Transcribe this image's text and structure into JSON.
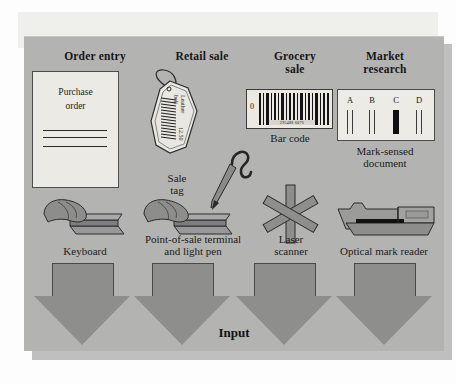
{
  "figure": {
    "background_color": "#b3b3b1",
    "bottom_label": "Input"
  },
  "columns": [
    {
      "title": "Order entry",
      "media": {
        "type": "purchase-order-document",
        "line1": "Purchase",
        "line2": "order"
      },
      "media_caption": "",
      "device": "keyboard-illustration",
      "device_caption": "Keyboard"
    },
    {
      "title": "Retail sale",
      "media": {
        "type": "sale-tag",
        "item": "Leather",
        "item2": "belt",
        "price": "12.50"
      },
      "media_caption_line1": "Sale",
      "media_caption_line2": "tag",
      "device": "pos-terminal-and-light-pen-illustration",
      "device_caption_line1": "Point-of-sale terminal",
      "device_caption_line2": "and light pen"
    },
    {
      "title_line1": "Grocery",
      "title_line2": "sale",
      "media": {
        "type": "bar-code",
        "lead_digit": "0",
        "number": "295488 6076"
      },
      "media_caption": "Bar code",
      "device": "laser-scanner-illustration",
      "device_caption_line1": "Laser",
      "device_caption_line2": "scanner"
    },
    {
      "title_line1": "Market",
      "title_line2": "research",
      "media": {
        "type": "mark-sensed-document",
        "options": [
          "A",
          "B",
          "C",
          "D"
        ],
        "selected": "C"
      },
      "media_caption_line1": "Mark-sensed",
      "media_caption_line2": "document",
      "device": "optical-mark-reader-illustration",
      "device_caption": "Optical mark reader"
    }
  ]
}
